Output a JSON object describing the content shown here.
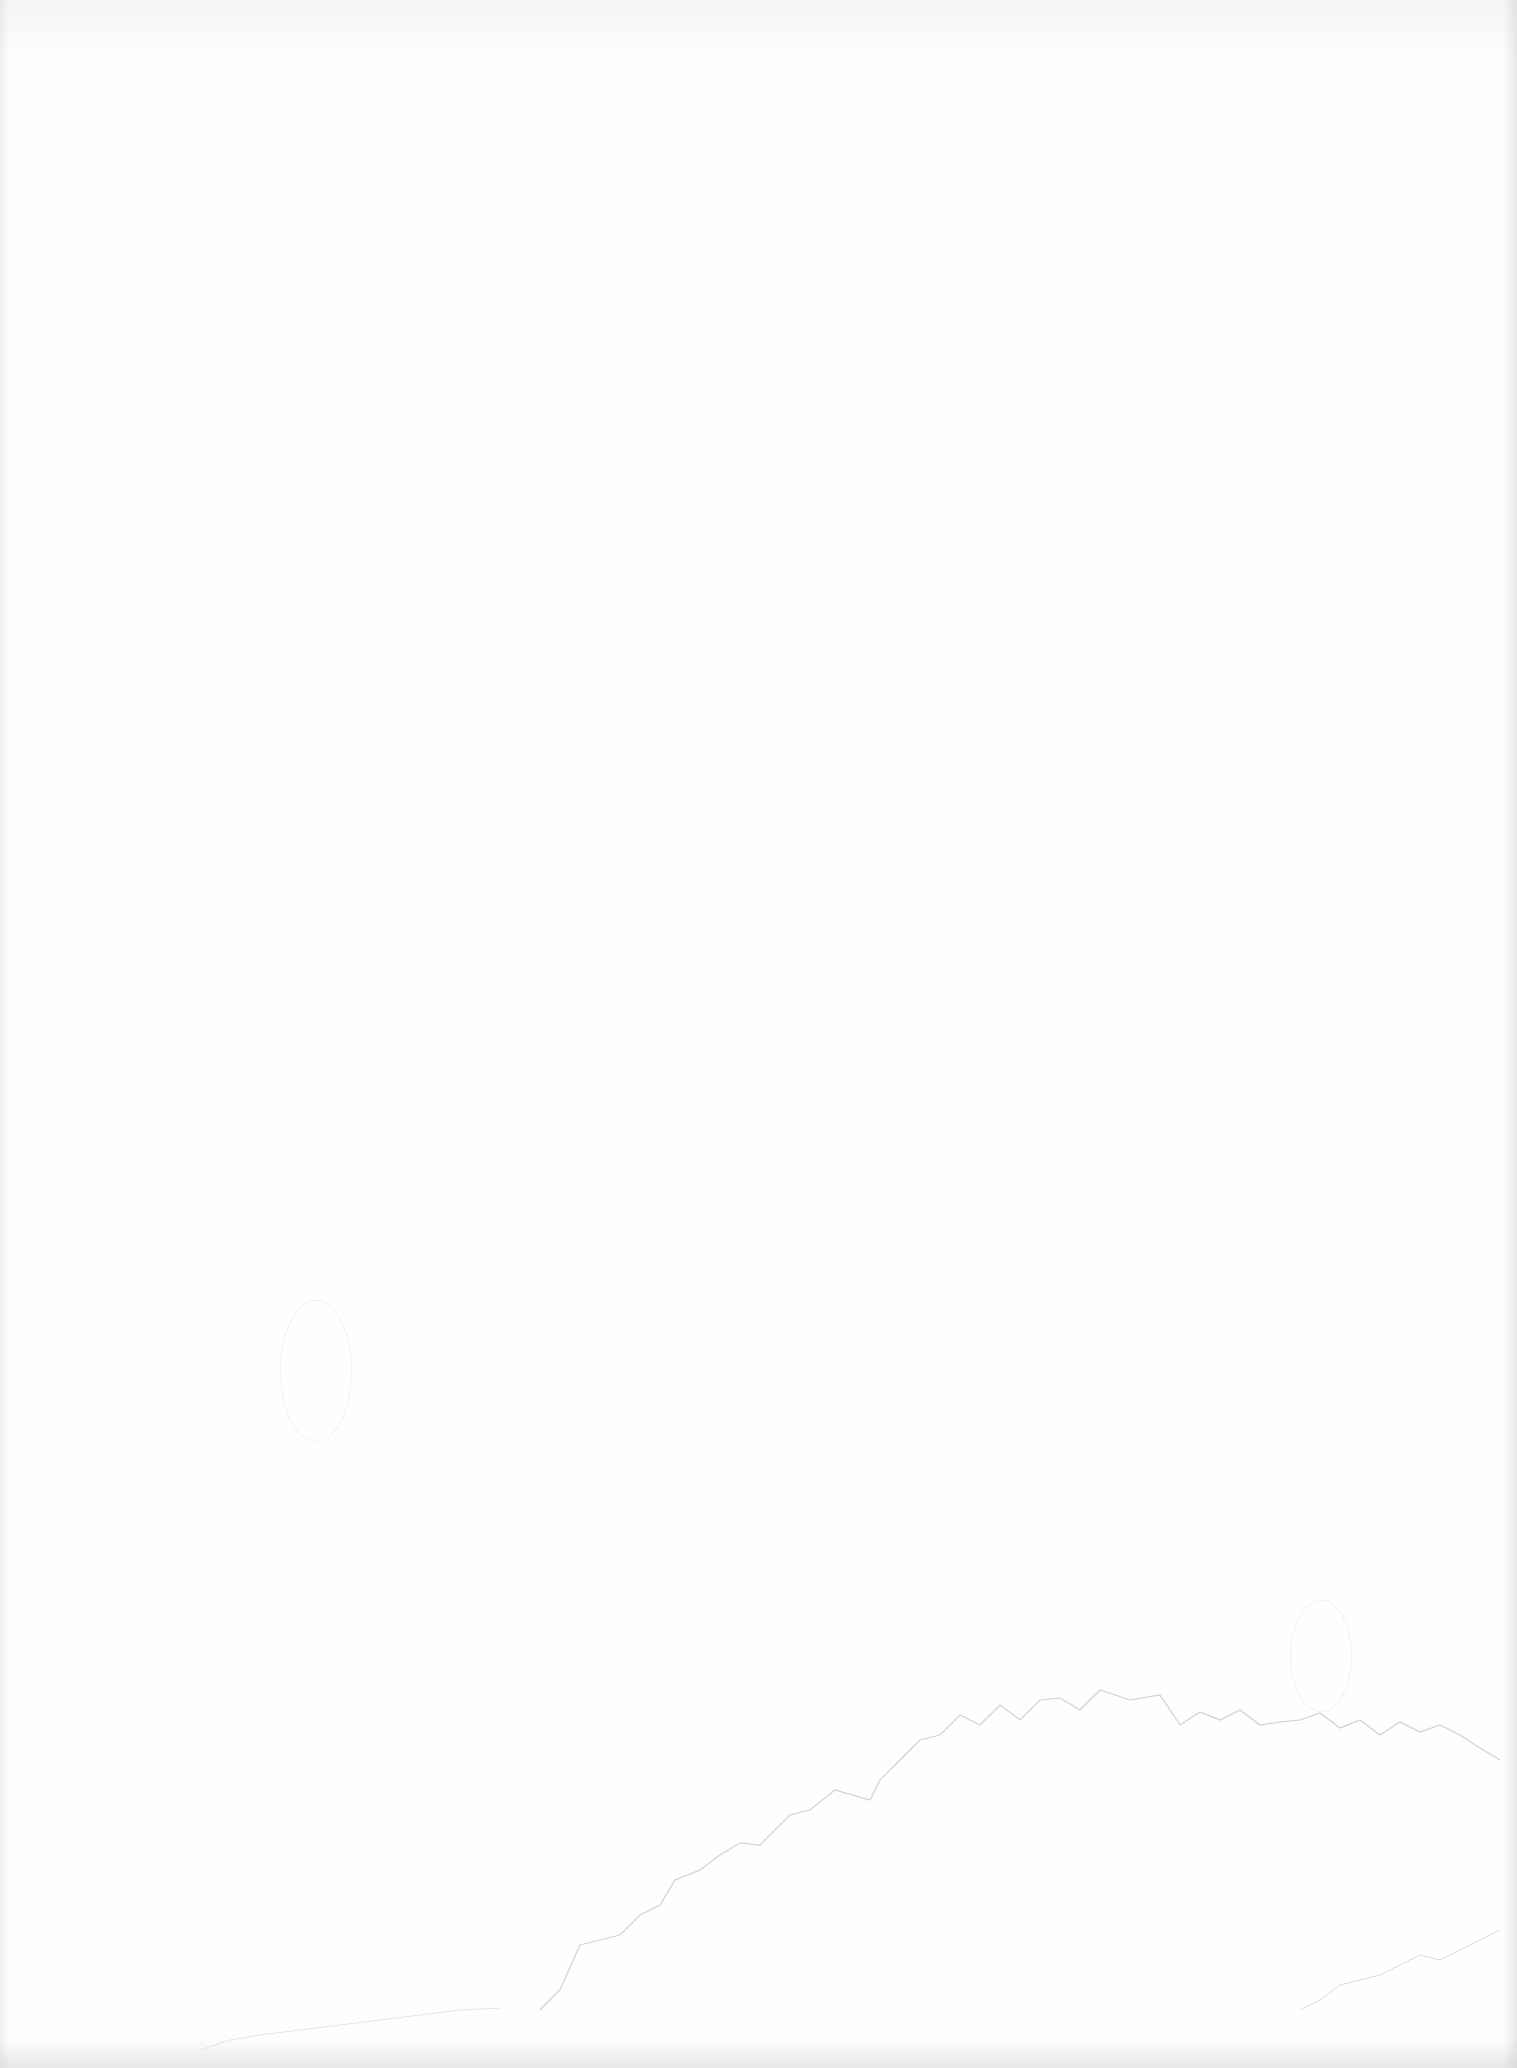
{
  "page": {
    "background_color": "#fefefe",
    "mark_color": "#b8b8b8",
    "text_content": []
  }
}
